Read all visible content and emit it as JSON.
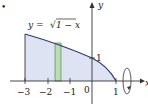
{
  "figure": {
    "bullet": "•",
    "equation": "y = √1 − x",
    "equation_parts": {
      "lhs": "y =",
      "radical": "√",
      "radicand": "1 − x"
    },
    "axis_labels": {
      "x": "x",
      "y": "y"
    },
    "x_ticks": [
      "−3",
      "−2",
      "−1",
      "0",
      "1"
    ],
    "y_tick": "1",
    "colors": {
      "region_fill": "#dde3f2",
      "curve": "#2b3a7a",
      "strip_fill": "#b9dcb0",
      "strip_stroke": "#3f7a3f",
      "axis": "#333333"
    },
    "region": {
      "x_from": -3,
      "x_to": 1
    },
    "strip_x": -1.5,
    "rotation_axis": "x-axis"
  }
}
